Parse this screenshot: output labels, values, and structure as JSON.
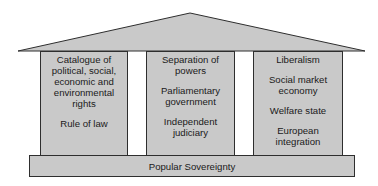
{
  "diagram": {
    "type": "temple",
    "colors": {
      "fill": "#c8c8c8",
      "stroke": "#333333",
      "background": "#ffffff"
    },
    "roof": {
      "label": ""
    },
    "pillars": [
      {
        "items": [
          "Catalogue of political, social, economic and environmental rights",
          "Rule of law"
        ]
      },
      {
        "items": [
          "Separation of powers",
          "Parliamentary government",
          "Independent judiciary"
        ]
      },
      {
        "items": [
          "Liberalism",
          "Social market economy",
          "Welfare state",
          "European integration"
        ]
      }
    ],
    "base": {
      "label": "Popular Sovereignty"
    }
  }
}
